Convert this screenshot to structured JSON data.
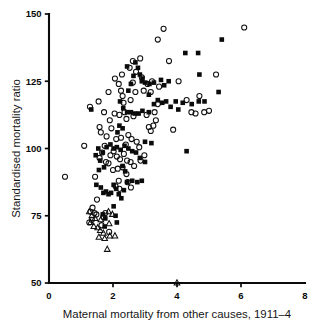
{
  "figure": {
    "width": 322,
    "height": 326,
    "background": "#ffffff",
    "ink_color": "#0a0a0a"
  },
  "chart_data": {
    "type": "scatter",
    "title": "",
    "subtitle": "",
    "xlabel": "Maternal mortality from other causes, 1911–4",
    "ylabel": "Standardised mortality ratio",
    "xlim": [
      0,
      8
    ],
    "ylim": [
      50,
      150
    ],
    "xticks": [
      0,
      2,
      4,
      6,
      8
    ],
    "yticks": [
      50,
      75,
      100,
      125,
      150
    ],
    "xticklabels": [
      "0",
      "2",
      "4",
      "6",
      "8"
    ],
    "yticklabels": [
      "50",
      "75",
      "100",
      "125",
      "150"
    ],
    "grid": false,
    "legend": false,
    "legend_position": "none",
    "annotations": [],
    "series": [
      {
        "name": "open-circle",
        "marker": "circle",
        "filled": false,
        "color": "#101010",
        "points": [
          [
            0.5,
            89.5
          ],
          [
            1.1,
            101.0
          ],
          [
            1.55,
            117.5
          ],
          [
            1.28,
            115.5
          ],
          [
            1.72,
            113.5
          ],
          [
            1.58,
            108.0
          ],
          [
            1.62,
            106.0
          ],
          [
            1.86,
            121.0
          ],
          [
            2.06,
            126.0
          ],
          [
            2.18,
            124.0
          ],
          [
            2.25,
            121.5
          ],
          [
            2.3,
            119.5
          ],
          [
            2.33,
            117.0
          ],
          [
            2.2,
            112.5
          ],
          [
            2.36,
            113.5
          ],
          [
            2.42,
            111.0
          ],
          [
            2.05,
            113.0
          ],
          [
            1.9,
            110.5
          ],
          [
            1.95,
            107.5
          ],
          [
            2.28,
            127.5
          ],
          [
            2.52,
            130.0
          ],
          [
            2.62,
            132.5
          ],
          [
            2.85,
            133.5
          ],
          [
            2.72,
            128.5
          ],
          [
            2.9,
            126.5
          ],
          [
            3.08,
            124.0
          ],
          [
            2.96,
            121.5
          ],
          [
            3.18,
            121.0
          ],
          [
            2.62,
            124.5
          ],
          [
            2.7,
            121.0
          ],
          [
            2.55,
            118.0
          ],
          [
            2.48,
            105.0
          ],
          [
            2.58,
            103.5
          ],
          [
            2.74,
            102.5
          ],
          [
            2.82,
            100.5
          ],
          [
            2.4,
            101.5
          ],
          [
            2.25,
            104.0
          ],
          [
            2.1,
            103.5
          ],
          [
            1.8,
            104.5
          ],
          [
            1.74,
            101.0
          ],
          [
            1.66,
            98.5
          ],
          [
            1.58,
            96.5
          ],
          [
            1.78,
            95.0
          ],
          [
            1.86,
            94.5
          ],
          [
            1.92,
            97.5
          ],
          [
            2.02,
            99.0
          ],
          [
            2.12,
            97.0
          ],
          [
            2.22,
            96.0
          ],
          [
            2.34,
            98.0
          ],
          [
            2.44,
            95.5
          ],
          [
            2.55,
            95.0
          ],
          [
            2.66,
            93.5
          ],
          [
            2.3,
            93.0
          ],
          [
            2.15,
            92.5
          ],
          [
            2.0,
            92.0
          ],
          [
            2.42,
            90.5
          ],
          [
            3.05,
            112.5
          ],
          [
            3.12,
            108.0
          ],
          [
            3.18,
            106.5
          ],
          [
            3.26,
            108.5
          ],
          [
            3.34,
            110.5
          ],
          [
            3.3,
            113.5
          ],
          [
            3.4,
            116.5
          ],
          [
            3.44,
            123.0
          ],
          [
            3.22,
            125.0
          ],
          [
            3.58,
            144.5
          ],
          [
            3.4,
            140.5
          ],
          [
            3.75,
            132.5
          ],
          [
            4.05,
            125.0
          ],
          [
            4.3,
            118.0
          ],
          [
            4.45,
            113.5
          ],
          [
            4.58,
            113.0
          ],
          [
            4.85,
            113.5
          ],
          [
            5.0,
            114.0
          ],
          [
            4.7,
            119.5
          ],
          [
            5.22,
            127.5
          ],
          [
            6.1,
            145.0
          ],
          [
            3.88,
            107.0
          ],
          [
            1.5,
            81.0
          ],
          [
            1.36,
            78.0
          ],
          [
            1.3,
            76.5
          ],
          [
            1.42,
            76.0
          ],
          [
            1.48,
            75.5
          ],
          [
            1.34,
            73.5
          ],
          [
            1.26,
            72.5
          ],
          [
            1.7,
            74.5
          ],
          [
            1.76,
            76.0
          ],
          [
            1.64,
            71.5
          ],
          [
            1.88,
            69.0
          ],
          [
            2.18,
            88.0
          ],
          [
            2.08,
            86.0
          ],
          [
            2.46,
            87.5
          ],
          [
            2.56,
            85.5
          ],
          [
            1.44,
            89.5
          ],
          [
            2.86,
            95.5
          ],
          [
            2.98,
            97.5
          ],
          [
            2.2,
            85.0
          ],
          [
            2.64,
            112.0
          ]
        ]
      },
      {
        "name": "filled-square",
        "marker": "square",
        "filled": true,
        "color": "#0b0b0b",
        "points": [
          [
            1.32,
            114.5
          ],
          [
            1.54,
            100.0
          ],
          [
            1.46,
            97.5
          ],
          [
            1.68,
            98.5
          ],
          [
            1.8,
            100.5
          ],
          [
            1.92,
            101.5
          ],
          [
            2.02,
            100.0
          ],
          [
            2.12,
            100.5
          ],
          [
            2.24,
            99.5
          ],
          [
            2.36,
            101.0
          ],
          [
            2.48,
            100.0
          ],
          [
            2.6,
            99.0
          ],
          [
            2.72,
            98.5
          ],
          [
            2.84,
            96.5
          ],
          [
            3.0,
            102.5
          ],
          [
            3.2,
            102.0
          ],
          [
            3.12,
            113.5
          ],
          [
            3.28,
            116.5
          ],
          [
            3.4,
            118.0
          ],
          [
            3.54,
            117.0
          ],
          [
            3.66,
            117.5
          ],
          [
            3.8,
            115.5
          ],
          [
            3.96,
            117.5
          ],
          [
            4.18,
            117.0
          ],
          [
            4.46,
            116.5
          ],
          [
            4.68,
            117.5
          ],
          [
            3.6,
            123.5
          ],
          [
            3.74,
            125.0
          ],
          [
            3.5,
            125.5
          ],
          [
            3.28,
            124.5
          ],
          [
            3.14,
            124.0
          ],
          [
            3.0,
            124.5
          ],
          [
            2.92,
            126.0
          ],
          [
            2.84,
            127.5
          ],
          [
            2.78,
            130.0
          ],
          [
            2.7,
            132.0
          ],
          [
            2.9,
            125.0
          ],
          [
            4.26,
            135.5
          ],
          [
            4.66,
            135.5
          ],
          [
            5.4,
            140.5
          ],
          [
            5.3,
            121.0
          ],
          [
            4.7,
            127.5
          ],
          [
            4.86,
            117.5
          ],
          [
            4.3,
            99.0
          ],
          [
            4.04,
            114.5
          ],
          [
            3.12,
            120.0
          ],
          [
            2.56,
            113.5
          ],
          [
            2.68,
            113.0
          ],
          [
            2.8,
            113.0
          ],
          [
            2.92,
            114.0
          ],
          [
            2.44,
            113.5
          ],
          [
            2.32,
            115.0
          ],
          [
            2.22,
            117.5
          ],
          [
            2.48,
            121.5
          ],
          [
            2.56,
            124.0
          ],
          [
            2.64,
            127.0
          ],
          [
            2.44,
            130.5
          ],
          [
            1.6,
            95.5
          ],
          [
            1.72,
            93.0
          ],
          [
            1.48,
            86.5
          ],
          [
            1.62,
            85.5
          ],
          [
            1.7,
            83.5
          ],
          [
            1.78,
            84.0
          ],
          [
            1.86,
            83.0
          ],
          [
            1.94,
            83.5
          ],
          [
            2.02,
            86.5
          ],
          [
            2.1,
            85.0
          ],
          [
            2.18,
            83.0
          ],
          [
            2.26,
            81.5
          ],
          [
            2.34,
            84.5
          ],
          [
            2.44,
            87.5
          ],
          [
            2.6,
            88.0
          ],
          [
            2.76,
            87.5
          ],
          [
            2.9,
            88.0
          ],
          [
            1.68,
            75.5
          ],
          [
            1.76,
            74.0
          ],
          [
            1.74,
            71.0
          ],
          [
            2.02,
            78.5
          ],
          [
            2.08,
            75.0
          ],
          [
            2.12,
            72.5
          ],
          [
            2.3,
            93.5
          ],
          [
            2.38,
            91.5
          ],
          [
            1.56,
            92.0
          ],
          [
            3.0,
            95.0
          ],
          [
            2.2,
            108.5
          ],
          [
            2.3,
            107.5
          ],
          [
            2.14,
            106.0
          ]
        ]
      },
      {
        "name": "open-triangle",
        "marker": "triangle",
        "filled": false,
        "color": "#101010",
        "points": [
          [
            1.26,
            76.5
          ],
          [
            1.34,
            75.0
          ],
          [
            1.44,
            74.0
          ],
          [
            1.3,
            72.5
          ],
          [
            1.4,
            71.0
          ],
          [
            1.52,
            70.5
          ],
          [
            1.6,
            69.5
          ],
          [
            1.7,
            68.5
          ],
          [
            1.62,
            73.5
          ],
          [
            1.86,
            76.5
          ],
          [
            1.98,
            75.5
          ],
          [
            1.88,
            72.0
          ],
          [
            1.56,
            67.0
          ],
          [
            1.74,
            66.5
          ],
          [
            1.9,
            67.5
          ],
          [
            2.06,
            67.5
          ],
          [
            1.82,
            62.5
          ],
          [
            4.0,
            50.0
          ]
        ]
      }
    ]
  },
  "axes": {
    "y_axis_label": "Standardised mortality ratio",
    "x_axis_label": "Maternal mortality from other causes, 1911–4"
  }
}
